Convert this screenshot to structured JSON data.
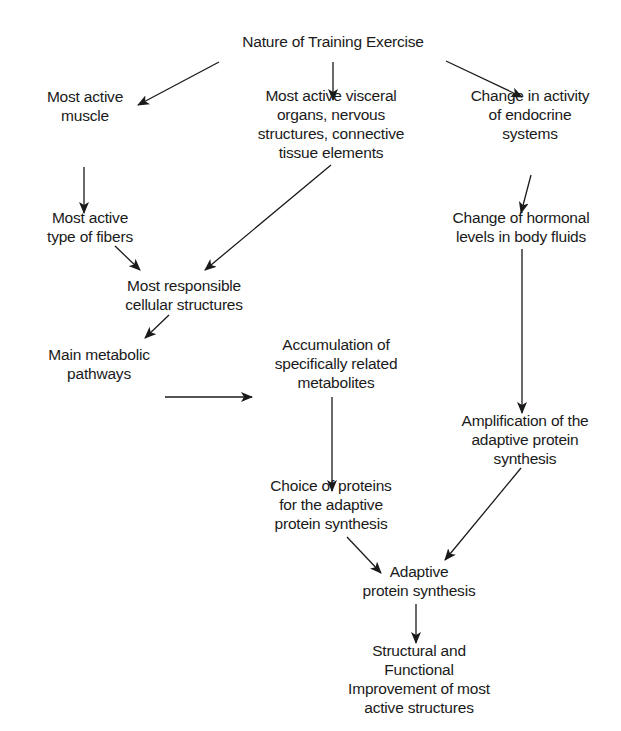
{
  "diagram": {
    "nodes": {
      "root": {
        "lines": [
          "Nature of Training Exercise"
        ]
      },
      "muscle": {
        "lines": [
          "Most active",
          "muscle"
        ]
      },
      "visceral": {
        "lines": [
          "Most active visceral",
          "organs, nervous",
          "structures, connective",
          "tissue elements"
        ]
      },
      "endocrine": {
        "lines": [
          "Change in activity",
          "of endocrine",
          "systems"
        ]
      },
      "fibers": {
        "lines": [
          "Most active",
          "type of fibers"
        ]
      },
      "hormonal": {
        "lines": [
          "Change of hormonal",
          "levels in body fluids"
        ]
      },
      "cellular": {
        "lines": [
          "Most responsible",
          "cellular structures"
        ]
      },
      "metabolic": {
        "lines": [
          "Main metabolic",
          "pathways"
        ]
      },
      "accumulation": {
        "lines": [
          "Accumulation of",
          "specifically related",
          "metabolites"
        ]
      },
      "amplification": {
        "lines": [
          "Amplification of the",
          "adaptive protein",
          "synthesis"
        ]
      },
      "choice": {
        "lines": [
          "Choice of proteins",
          "for the adaptive",
          "protein synthesis"
        ]
      },
      "adaptive": {
        "lines": [
          "Adaptive",
          "protein synthesis"
        ]
      },
      "improvement": {
        "lines": [
          "Structural and",
          "Functional",
          "Improvement of most",
          "active structures"
        ]
      }
    },
    "edges": [
      [
        "root",
        "muscle"
      ],
      [
        "root",
        "visceral"
      ],
      [
        "root",
        "endocrine"
      ],
      [
        "muscle",
        "fibers"
      ],
      [
        "fibers",
        "cellular"
      ],
      [
        "visceral",
        "cellular"
      ],
      [
        "cellular",
        "metabolic"
      ],
      [
        "metabolic",
        "accumulation"
      ],
      [
        "accumulation",
        "choice"
      ],
      [
        "endocrine",
        "hormonal"
      ],
      [
        "hormonal",
        "amplification"
      ],
      [
        "choice",
        "adaptive"
      ],
      [
        "amplification",
        "adaptive"
      ],
      [
        "adaptive",
        "improvement"
      ]
    ],
    "colors": {
      "ink": "#1a1a1a",
      "background": "#ffffff"
    }
  }
}
